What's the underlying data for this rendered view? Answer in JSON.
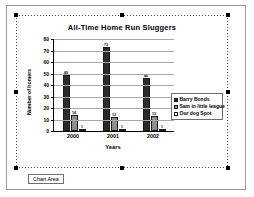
{
  "chart_data": {
    "type": "bar",
    "title": "All-Time Home Run Sluggers",
    "xlabel": "Years",
    "ylabel": "Number of homers",
    "categories": [
      "2000",
      "2001",
      "2002"
    ],
    "series": [
      {
        "name": "Barry Bonds",
        "color": "#2b2b2b",
        "values": [
          49,
          73,
          46
        ]
      },
      {
        "name": "Sam in little league",
        "color": "#8d8d8d",
        "values": [
          14,
          12,
          13
        ]
      },
      {
        "name": "Our dog Spot",
        "color": "#ffffff",
        "values": [
          1,
          1,
          1
        ]
      }
    ],
    "ylim": [
      0,
      80
    ],
    "yticks": [
      80,
      70,
      60,
      50,
      40,
      30,
      20,
      10,
      0
    ],
    "grid": true,
    "legend_position": "right"
  },
  "selection": {
    "name_box_label": "Chart Area"
  }
}
